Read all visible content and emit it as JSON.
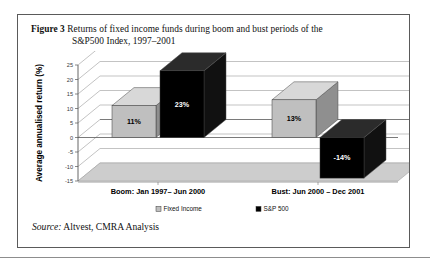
{
  "figure": {
    "number_label": "Figure 3",
    "caption_line1": "Returns of fixed income funds during boom and bust periods of the",
    "caption_line2": "S&P500 Index, 1997–2001",
    "source_prefix": "Source:",
    "source_text": "Altvest, CMRA Analysis"
  },
  "colors": {
    "fixed_income": "#bfbfbf",
    "fixed_income_top": "#d8d8d8",
    "fixed_income_side": "#8f8f8f",
    "sp500": "#000000",
    "sp500_top": "#2b2b2b",
    "sp500_side": "#111111",
    "floor": "#cdcdcd",
    "gridline": "#9a9a9a",
    "axis": "#555555",
    "border": "#5a5a5a"
  },
  "chart_data": {
    "type": "bar",
    "title": "Returns of fixed income funds during boom and bust periods of the S&P500 Index, 1997–2001",
    "xlabel": "",
    "ylabel": "Average annualised return (%)",
    "ylim": [
      -15,
      25
    ],
    "yticks": [
      25,
      20,
      15,
      10,
      5,
      0,
      -5,
      -10,
      -15
    ],
    "ytick_labels": [
      "25",
      "20",
      "15",
      "10",
      "5",
      "0",
      "-5",
      "-10",
      "-15"
    ],
    "grid": true,
    "legend_position": "bottom",
    "three_d": true,
    "categories": [
      "Boom: Jan 1997– Jun 2000",
      "Bust: Jun 2000 – Dec 2001"
    ],
    "series": [
      {
        "name": "Fixed Income",
        "color": "#bfbfbf",
        "values": [
          11,
          13
        ],
        "data_labels": [
          "11%",
          "13%"
        ]
      },
      {
        "name": "S&P 500",
        "color": "#000000",
        "values": [
          23,
          -14
        ],
        "data_labels": [
          "23%",
          "-14%"
        ]
      }
    ]
  },
  "legend": [
    {
      "label": "Fixed Income",
      "marker": "gray-square-marker"
    },
    {
      "label": "S&P 500",
      "marker": "black-square-marker"
    }
  ]
}
